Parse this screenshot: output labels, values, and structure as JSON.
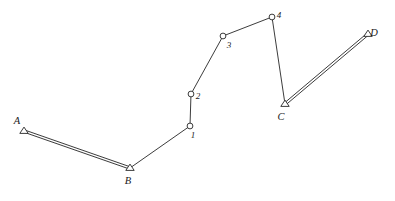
{
  "figure": {
    "background_color": "#ffffff",
    "line_color": "#262626",
    "marker_fill": "#ffffff",
    "width": 395,
    "height": 201
  },
  "control_points": [
    {
      "id": "A",
      "label": "A",
      "marker": "triangle",
      "x": 24,
      "y": 131,
      "label_x": 17,
      "label_y": 124
    },
    {
      "id": "B",
      "label": "B",
      "marker": "triangle",
      "x": 130,
      "y": 168,
      "label_x": 128,
      "label_y": 184
    },
    {
      "id": "C",
      "label": "C",
      "marker": "triangle",
      "x": 285,
      "y": 104,
      "label_x": 281,
      "label_y": 120
    },
    {
      "id": "D",
      "label": "D",
      "marker": "triangle",
      "x": 368,
      "y": 34,
      "label_x": 374,
      "label_y": 36
    }
  ],
  "stations": [
    {
      "id": "1",
      "label": "1",
      "marker": "circle",
      "x": 190,
      "y": 126,
      "label_x": 193,
      "label_y": 138
    },
    {
      "id": "2",
      "label": "2",
      "marker": "circle",
      "x": 191,
      "y": 94,
      "label_x": 198,
      "label_y": 99
    },
    {
      "id": "3",
      "label": "3",
      "marker": "circle",
      "x": 223,
      "y": 36,
      "label_x": 229,
      "label_y": 48
    },
    {
      "id": "4",
      "label": "4",
      "marker": "circle",
      "x": 272,
      "y": 17,
      "label_x": 279,
      "label_y": 18
    }
  ],
  "segments": [
    {
      "id": "A-B",
      "from": "A",
      "to": "B",
      "style": "double",
      "x1": 24,
      "y1": 131,
      "x2": 130,
      "y2": 168
    },
    {
      "id": "B-1",
      "from": "B",
      "to": "1",
      "style": "single",
      "x1": 130,
      "y1": 168,
      "x2": 190,
      "y2": 126
    },
    {
      "id": "1-2",
      "from": "1",
      "to": "2",
      "style": "single",
      "x1": 190,
      "y1": 126,
      "x2": 191,
      "y2": 94
    },
    {
      "id": "2-3",
      "from": "2",
      "to": "3",
      "style": "single",
      "x1": 191,
      "y1": 94,
      "x2": 223,
      "y2": 36
    },
    {
      "id": "3-4",
      "from": "3",
      "to": "4",
      "style": "single",
      "x1": 223,
      "y1": 36,
      "x2": 272,
      "y2": 17
    },
    {
      "id": "4-C",
      "from": "4",
      "to": "C",
      "style": "single",
      "x1": 272,
      "y1": 17,
      "x2": 285,
      "y2": 104
    },
    {
      "id": "C-D",
      "from": "C",
      "to": "D",
      "style": "double",
      "x1": 285,
      "y1": 104,
      "x2": 368,
      "y2": 34
    }
  ]
}
